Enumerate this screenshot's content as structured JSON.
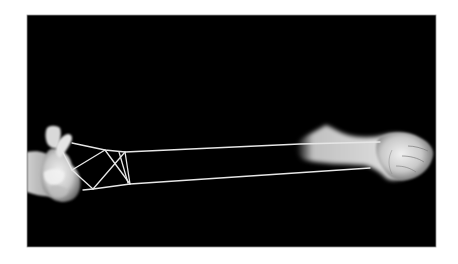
{
  "image": {
    "description": "Black-and-white photograph of two hands playing a string figure (cat's cradle) against a black background",
    "alt": "Hands stretching a string figure",
    "colors": {
      "border": "#ffffff",
      "background": "#000000",
      "string": "#e6e6e6",
      "skin_light": "#eeeeee",
      "skin_mid": "#bdbdbd",
      "skin_shadow": "#6a6a6a"
    }
  }
}
